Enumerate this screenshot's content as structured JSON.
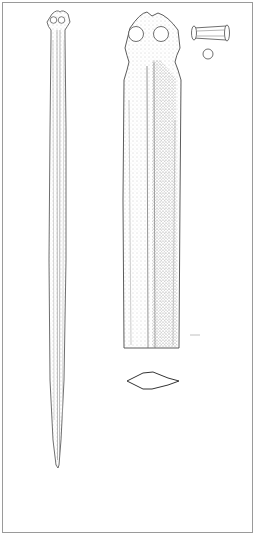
{
  "plate": {
    "description": "Archaeological line drawing of a bronze dagger/sword",
    "colors": {
      "background": "#ffffff",
      "frame": "#9a9a9a",
      "outline": "#4a4a4a",
      "stipple": "#8a8a8a"
    },
    "views": [
      {
        "id": "full-blade",
        "label": "full blade view with two-rivet hilt plate"
      },
      {
        "id": "hilt-detail",
        "label": "enlarged hilt and upper blade detail"
      },
      {
        "id": "rivet-side",
        "label": "rivet side view"
      },
      {
        "id": "rivet-end",
        "label": "rivet end view"
      },
      {
        "id": "cross-section",
        "label": "lozenge blade cross-section"
      },
      {
        "id": "scale-mark",
        "label": "section marker"
      }
    ],
    "text": []
  }
}
